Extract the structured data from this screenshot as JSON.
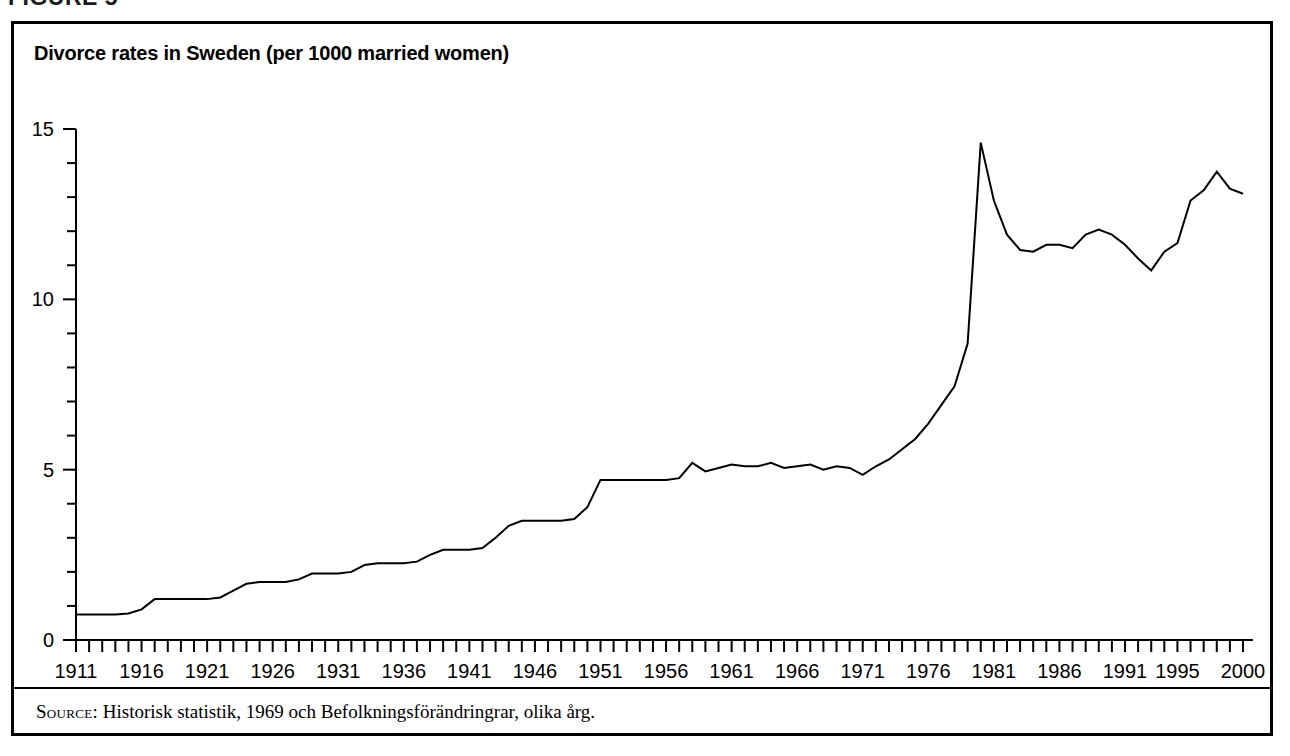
{
  "figure": {
    "caption": "FIGURE 5"
  },
  "source": {
    "label": "Source:",
    "text": "Historisk statistik, 1969 och Befolkningsförändringrar, olika årg."
  },
  "chart_data": {
    "type": "line",
    "title": "Divorce rates in Sweden (per 1000 married women)",
    "xlabel": "",
    "ylabel": "",
    "xlim": [
      1911,
      2000
    ],
    "ylim": [
      0,
      15
    ],
    "yticks": [
      0,
      5,
      10,
      15
    ],
    "yticklabels": [
      "0",
      "5",
      "10",
      "15"
    ],
    "yminor_step": 1,
    "xticks_step": 1,
    "xticklabels": [
      "1911",
      "1916",
      "1921",
      "1926",
      "1931",
      "1936",
      "1941",
      "1946",
      "1951",
      "1956",
      "1961",
      "1966",
      "1971",
      "1976",
      "1981",
      "1986",
      "1991",
      "1995",
      "2000"
    ],
    "xticklabel_years": [
      1911,
      1916,
      1921,
      1926,
      1931,
      1936,
      1941,
      1946,
      1951,
      1956,
      1961,
      1966,
      1971,
      1976,
      1981,
      1986,
      1991,
      1995,
      2000
    ],
    "grid": false,
    "legend": null,
    "line_color": "#000000",
    "x": [
      1911,
      1912,
      1913,
      1914,
      1915,
      1916,
      1917,
      1918,
      1919,
      1920,
      1921,
      1922,
      1923,
      1924,
      1925,
      1926,
      1927,
      1928,
      1929,
      1930,
      1931,
      1932,
      1933,
      1934,
      1935,
      1936,
      1937,
      1938,
      1939,
      1940,
      1941,
      1942,
      1943,
      1944,
      1945,
      1946,
      1947,
      1948,
      1949,
      1950,
      1951,
      1952,
      1953,
      1954,
      1955,
      1956,
      1957,
      1958,
      1959,
      1960,
      1961,
      1962,
      1963,
      1964,
      1965,
      1966,
      1967,
      1968,
      1969,
      1970,
      1971,
      1972,
      1973,
      1974,
      1975,
      1976,
      1977,
      1978,
      1979,
      1980,
      1981,
      1982,
      1983,
      1984,
      1985,
      1986,
      1987,
      1988,
      1989,
      1990,
      1991,
      1992,
      1993,
      1994,
      1995,
      1996,
      1997,
      1998,
      1999,
      2000
    ],
    "y": [
      0.75,
      0.75,
      0.75,
      0.75,
      0.78,
      0.9,
      1.2,
      1.2,
      1.2,
      1.2,
      1.2,
      1.25,
      1.45,
      1.65,
      1.7,
      1.7,
      1.7,
      1.78,
      1.95,
      1.95,
      1.95,
      2.0,
      2.2,
      2.25,
      2.25,
      2.25,
      2.3,
      2.5,
      2.65,
      2.65,
      2.65,
      2.7,
      3.0,
      3.35,
      3.5,
      3.5,
      3.5,
      3.5,
      3.55,
      3.9,
      4.7,
      4.7,
      4.7,
      4.7,
      4.7,
      4.7,
      4.75,
      5.2,
      4.95,
      5.05,
      5.15,
      5.1,
      5.1,
      5.2,
      5.05,
      5.1,
      5.15,
      5.0,
      5.1,
      5.05,
      4.85,
      5.1,
      5.3,
      5.6,
      5.9,
      6.35,
      6.9,
      7.45,
      8.7,
      14.6,
      12.9,
      11.9,
      11.45,
      11.4,
      11.6,
      11.6,
      11.5,
      11.9,
      12.05,
      11.9,
      11.6,
      11.2,
      10.85,
      11.4,
      11.65,
      12.9,
      13.2,
      13.75,
      13.25,
      13.1,
      13.2,
      13.75
    ],
    "annotations": []
  }
}
